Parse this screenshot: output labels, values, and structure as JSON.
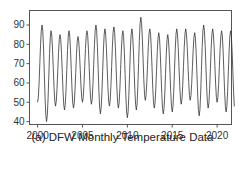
{
  "chart_data": {
    "type": "line",
    "title": "",
    "caption": "(a) DFW Monthly Temperature Data",
    "xlabel": "",
    "ylabel": "",
    "xlim": [
      1999.1,
      2021.6
    ],
    "ylim": [
      38.5,
      97.5
    ],
    "x_ticks": [
      2000,
      2005,
      2010,
      2015,
      2020
    ],
    "y_ticks": [
      40,
      50,
      60,
      70,
      80,
      90
    ],
    "grid": false,
    "legend": null,
    "series": [
      {
        "name": "DFW monthly temperature",
        "start": 2000.0,
        "frequency": "monthly",
        "annual_extremes": [
          {
            "year": 2000,
            "winter": 50,
            "summer": 90
          },
          {
            "year": 2001,
            "winter": 40,
            "summer": 87
          },
          {
            "year": 2002,
            "winter": 48,
            "summer": 85
          },
          {
            "year": 2003,
            "winter": 46,
            "summer": 87
          },
          {
            "year": 2004,
            "winter": 47,
            "summer": 84
          },
          {
            "year": 2005,
            "winter": 50,
            "summer": 87
          },
          {
            "year": 2006,
            "winter": 49,
            "summer": 90
          },
          {
            "year": 2007,
            "winter": 44,
            "summer": 88
          },
          {
            "year": 2008,
            "winter": 48,
            "summer": 89
          },
          {
            "year": 2009,
            "winter": 47,
            "summer": 87
          },
          {
            "year": 2010,
            "winter": 42,
            "summer": 88
          },
          {
            "year": 2011,
            "winter": 46,
            "summer": 94
          },
          {
            "year": 2012,
            "winter": 51,
            "summer": 88
          },
          {
            "year": 2013,
            "winter": 47,
            "summer": 86
          },
          {
            "year": 2014,
            "winter": 44,
            "summer": 85
          },
          {
            "year": 2015,
            "winter": 45,
            "summer": 88
          },
          {
            "year": 2016,
            "winter": 49,
            "summer": 88
          },
          {
            "year": 2017,
            "winter": 51,
            "summer": 86
          },
          {
            "year": 2018,
            "winter": 43,
            "summer": 90
          },
          {
            "year": 2019,
            "winter": 47,
            "summer": 88
          },
          {
            "year": 2020,
            "winter": 50,
            "summer": 87
          },
          {
            "year": 2021,
            "winter": 45,
            "summer": 87
          }
        ],
        "color": "#333333"
      }
    ]
  }
}
